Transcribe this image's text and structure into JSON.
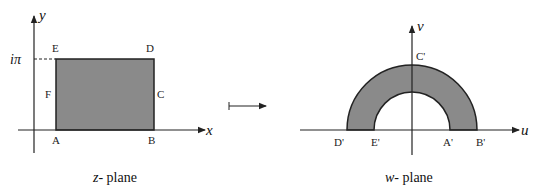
{
  "colors": {
    "fill": "#8a8a8a",
    "line": "#222222",
    "background": "#ffffff"
  },
  "z_plane": {
    "caption_var": "z",
    "caption_text": "- plane",
    "x_axis_label": "x",
    "y_axis_label": "y",
    "y_tick_label": "iπ",
    "points": {
      "A": "A",
      "B": "B",
      "C": "C",
      "D": "D",
      "E": "E",
      "F": "F"
    }
  },
  "mapping_arrow": {
    "icon": "maps-to-arrow-icon"
  },
  "w_plane": {
    "caption_var": "w",
    "caption_text": "- plane",
    "u_axis_label": "u",
    "v_axis_label": "v",
    "points": {
      "A": "A'",
      "B": "B'",
      "C": "C'",
      "D": "D'",
      "E": "E'"
    }
  }
}
